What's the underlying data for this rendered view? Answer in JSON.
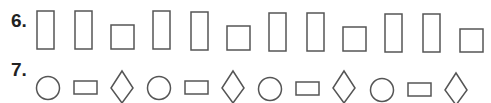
{
  "colors": {
    "stroke": "#555555",
    "label": "#222222",
    "background": "#ffffff"
  },
  "rows": [
    {
      "label": "6.",
      "pattern": [
        "tall-rectangle",
        "tall-rectangle",
        "square",
        "tall-rectangle",
        "tall-rectangle",
        "square",
        "tall-rectangle",
        "tall-rectangle",
        "square",
        "tall-rectangle",
        "tall-rectangle",
        "square"
      ]
    },
    {
      "label": "7.",
      "pattern": [
        "circle",
        "rectangle",
        "diamond",
        "circle",
        "rectangle",
        "diamond",
        "circle",
        "rectangle",
        "diamond",
        "circle",
        "rectangle",
        "diamond"
      ]
    }
  ]
}
